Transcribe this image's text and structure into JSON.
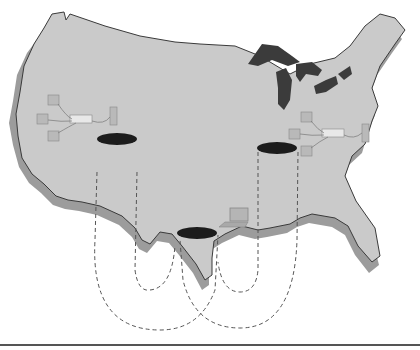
{
  "diagram": {
    "title": "",
    "colors": {
      "background": "#ffffff",
      "land": "#c9c9c9",
      "land_shadow": "#9a9a9a",
      "coastline": "#3a3a3a",
      "lakes": "#3b3b3b",
      "cylinder_top": "#1c1c1c",
      "dashed_link": "#555555",
      "bottom_rule": "#555555"
    },
    "nodes": [
      {
        "id": "west-lan",
        "type": "lan-cluster",
        "components": [
          "workstation",
          "workstation",
          "workstation",
          "hub",
          "server"
        ]
      },
      {
        "id": "east-lan",
        "type": "lan-cluster",
        "components": [
          "workstation",
          "workstation",
          "workstation",
          "hub",
          "server"
        ]
      },
      {
        "id": "west-db",
        "type": "cylinder"
      },
      {
        "id": "east-db",
        "type": "cylinder"
      },
      {
        "id": "south-db",
        "type": "cylinder"
      },
      {
        "id": "laptop",
        "type": "laptop"
      }
    ],
    "links": [
      {
        "from": "west-db",
        "to": "south-db",
        "style": "dashed"
      },
      {
        "from": "east-db",
        "to": "south-db",
        "style": "dashed"
      },
      {
        "from": "west-db",
        "to": "east-db",
        "style": "dashed"
      }
    ]
  }
}
